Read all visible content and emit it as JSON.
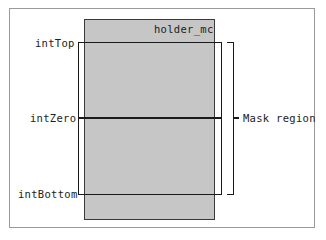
{
  "diagram": {
    "holder_label": "holder_mc",
    "labels": {
      "top": "intTop",
      "zero": "intZero",
      "bottom": "intBottom"
    },
    "mask_label": "Mask region"
  }
}
